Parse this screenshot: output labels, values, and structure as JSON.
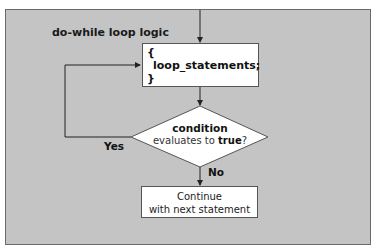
{
  "diagram": {
    "title": "do-while loop logic",
    "body_box": {
      "open_brace": "{",
      "statement": "loop_statements;",
      "close_brace": "}"
    },
    "decision": {
      "line1": "condition",
      "line2_prefix": "evaluates to ",
      "line2_bold": "true",
      "line2_suffix": "?"
    },
    "yes_label": "Yes",
    "no_label": "No",
    "end_box": {
      "line1": "Continue",
      "line2": "with next statement"
    },
    "colors": {
      "panel_bg": "#c4c4c4",
      "box_bg": "#ffffff",
      "line": "#222222"
    }
  }
}
